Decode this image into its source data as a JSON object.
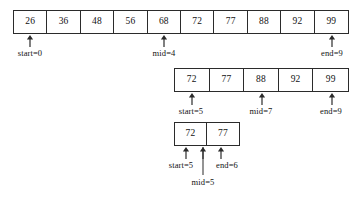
{
  "figure": {
    "colors": {
      "background": "#ffffff",
      "stroke": "#2b2b2b",
      "text": "#111111"
    }
  },
  "rows": [
    {
      "id": "row-1",
      "values": [
        "26",
        "36",
        "48",
        "56",
        "68",
        "72",
        "77",
        "88",
        "92",
        "99"
      ],
      "markers": [
        {
          "id": "start",
          "label": "start=0",
          "cell_index": 0
        },
        {
          "id": "mid",
          "label": "mid=4",
          "cell_index": 4
        },
        {
          "id": "end",
          "label": "end=9",
          "cell_index": 9
        }
      ]
    },
    {
      "id": "row-2",
      "values": [
        "72",
        "77",
        "88",
        "92",
        "99"
      ],
      "markers": [
        {
          "id": "start",
          "label": "start=5",
          "cell_index": 0
        },
        {
          "id": "mid",
          "label": "mid=7",
          "cell_index": 2
        },
        {
          "id": "end",
          "label": "end=9",
          "cell_index": 4
        }
      ]
    },
    {
      "id": "row-3",
      "values": [
        "72",
        "77"
      ],
      "markers": [
        {
          "id": "start",
          "label": "start=5",
          "cell_index": 0
        },
        {
          "id": "mid",
          "label": "mid=5",
          "cell_index": 0
        },
        {
          "id": "end",
          "label": "end=6",
          "cell_index": 1
        }
      ]
    }
  ],
  "labels": {
    "row1_start": "start=0",
    "row1_mid": "mid=4",
    "row1_end": "end=9",
    "row2_start": "start=5",
    "row2_mid": "mid=7",
    "row2_end": "end=9",
    "row3_start": "start=5",
    "row3_mid": "mid=5",
    "row3_end": "end=6"
  }
}
